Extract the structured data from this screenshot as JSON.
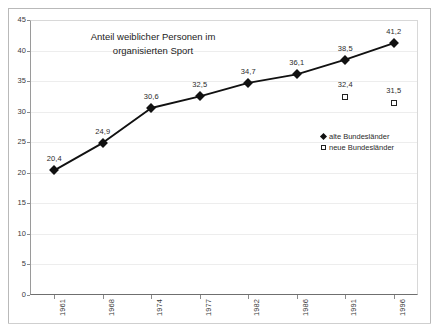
{
  "chart_data": {
    "type": "line",
    "title": "Anteil weiblicher Personen im organisierten Sport",
    "title_line1": "Anteil weiblicher Personen im",
    "title_line2": "organisierten Sport",
    "xlabel": "",
    "ylabel": "",
    "categories": [
      "1961",
      "1968",
      "1974",
      "1977",
      "1982",
      "1986",
      "1991",
      "1996"
    ],
    "ylim": [
      0,
      45
    ],
    "ytick_step": 5,
    "yticks": [
      "0",
      "5",
      "10",
      "15",
      "20",
      "25",
      "30",
      "35",
      "40",
      "45"
    ],
    "grid": true,
    "legend_position": "center-right",
    "series": [
      {
        "name": "alte Bundesländer",
        "marker": "filled-diamond",
        "color": "#111111",
        "line": true,
        "values": [
          20.4,
          24.9,
          30.6,
          32.5,
          34.7,
          36.1,
          38.5,
          41.2
        ],
        "labels": [
          "20,4",
          "24,9",
          "30,6",
          "32,5",
          "34,7",
          "36,1",
          "38,5",
          "41,2"
        ]
      },
      {
        "name": "neue Bundesländer",
        "marker": "open-square",
        "color": "#222222",
        "line": false,
        "values": [
          null,
          null,
          null,
          null,
          null,
          null,
          32.4,
          31.5
        ],
        "labels": [
          null,
          null,
          null,
          null,
          null,
          null,
          "32,4",
          "31,5"
        ]
      }
    ]
  },
  "legend": {
    "items": [
      {
        "label": "alte Bundesländer",
        "marker": "filled-diamond"
      },
      {
        "label": "neue Bundesländer",
        "marker": "open-square"
      }
    ]
  }
}
